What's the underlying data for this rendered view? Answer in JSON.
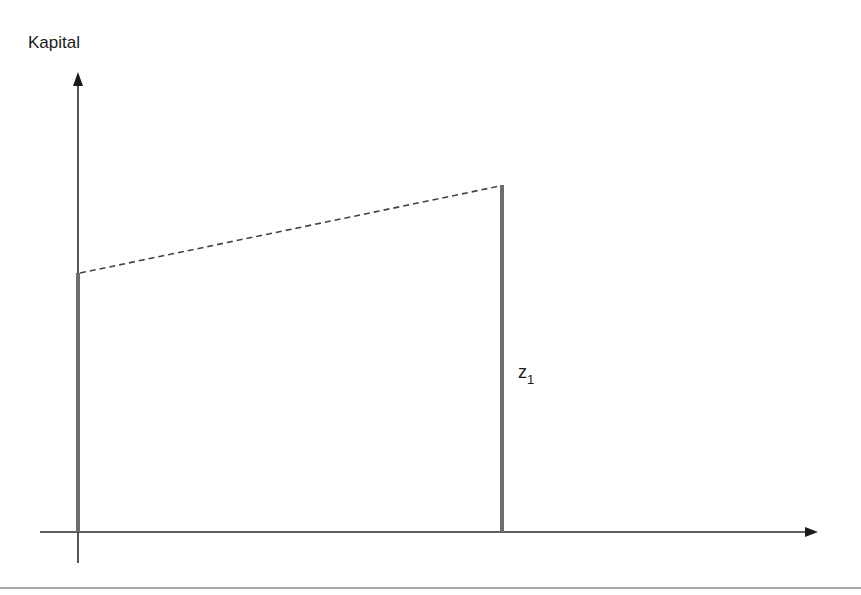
{
  "diagram": {
    "y_axis_label": "Kapital",
    "bar_label_main": "z",
    "bar_label_sub": "1",
    "colors": {
      "axis": "#2a2a2a",
      "bar": "#6e6e6e",
      "dashed": "#444444",
      "rule": "#8a8a8a"
    }
  }
}
